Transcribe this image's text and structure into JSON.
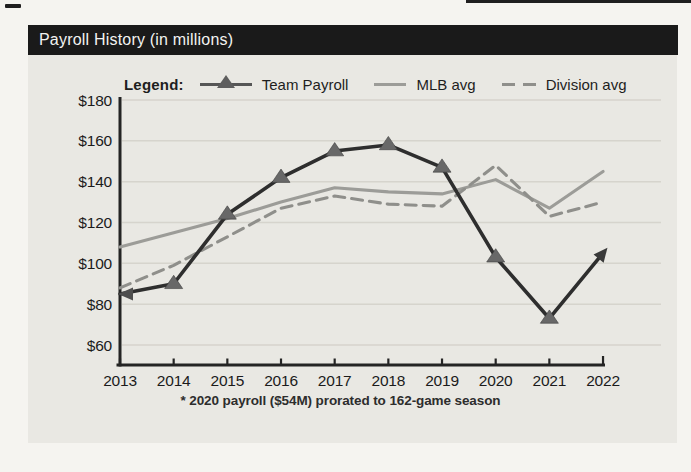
{
  "header": {
    "title": "Payroll History (in millions)"
  },
  "legend": {
    "label": "Legend:",
    "items": [
      {
        "label": "Team Payroll"
      },
      {
        "label": "MLB avg"
      },
      {
        "label": "Division avg"
      }
    ]
  },
  "footnote": "* 2020 payroll ($54M) prorated to 162-game season",
  "colors": {
    "title_bar_bg": "#1a1a1a",
    "title_text": "#f3f3f1",
    "panel_bg": "#e9e8e3",
    "page_bg": "#f5f4f0",
    "axis": "#242424",
    "gridline": "#d3d1ca",
    "team_payroll_line": "#2e2e2e",
    "team_payroll_marker": "#686868",
    "mlb_avg_line": "#9c9c98",
    "division_avg_line": "#8f8f8b"
  },
  "chart_data": {
    "type": "line",
    "title": "Payroll History (in millions)",
    "xlabel": "",
    "ylabel": "",
    "x": [
      "2013",
      "2014",
      "2015",
      "2016",
      "2017",
      "2018",
      "2019",
      "2020",
      "2021",
      "2022"
    ],
    "series": [
      {
        "name": "Team Payroll",
        "line": "solid",
        "marker": "triangle",
        "start_arrow": true,
        "end_arrow": true,
        "color": "#2e2e2e",
        "marker_color": "#686868",
        "values": [
          85,
          90,
          124,
          142,
          155,
          158,
          147,
          103,
          73,
          105
        ]
      },
      {
        "name": "MLB avg",
        "line": "solid",
        "marker": "none",
        "color": "#9c9c98",
        "values": [
          108,
          115,
          122,
          130,
          137,
          135,
          134,
          141,
          127,
          145
        ]
      },
      {
        "name": "Division avg",
        "line": "dashed",
        "marker": "none",
        "color": "#8f8f8b",
        "values": [
          88,
          99,
          113,
          127,
          133,
          129,
          128,
          148,
          123,
          130
        ]
      }
    ],
    "ylim": [
      50,
      185
    ],
    "yticks": [
      60,
      80,
      100,
      120,
      140,
      160,
      180
    ],
    "ytick_prefix": "$",
    "grid": true,
    "legend_position": "top",
    "footnote": "* 2020 payroll ($54M) prorated to 162-game season"
  }
}
